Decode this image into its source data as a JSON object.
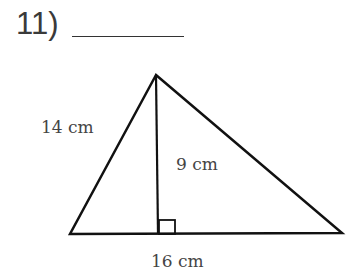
{
  "question": {
    "number_label": "11)",
    "answer_blank": ""
  },
  "diagram": {
    "shape": "triangle",
    "side_label": "14 cm",
    "height_label": "9 cm",
    "base_label": "16 cm",
    "right_angle_marker": true,
    "stroke_color": "#111111"
  }
}
